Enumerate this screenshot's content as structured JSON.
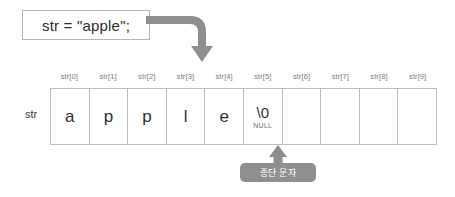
{
  "diagram": {
    "code_box": {
      "text": "str = \"apple\";"
    },
    "array": {
      "row_label": "str",
      "index_labels": [
        "str[0]",
        "str[1]",
        "str[2]",
        "str[3]",
        "str[4]",
        "str[5]",
        "str[6]",
        "str[7]",
        "str[8]",
        "str[9]"
      ],
      "cells": [
        {
          "value": "a",
          "sub": ""
        },
        {
          "value": "p",
          "sub": ""
        },
        {
          "value": "p",
          "sub": ""
        },
        {
          "value": "l",
          "sub": ""
        },
        {
          "value": "e",
          "sub": ""
        },
        {
          "value": "\\0",
          "sub": "NULL"
        },
        {
          "value": "",
          "sub": ""
        },
        {
          "value": "",
          "sub": ""
        },
        {
          "value": "",
          "sub": ""
        },
        {
          "value": "",
          "sub": ""
        }
      ]
    },
    "callout": {
      "label": "종단 문자"
    },
    "colors": {
      "arrow": "#8f8f8f",
      "badge": "#8f8f8f",
      "cell_border": "#bcbcbc",
      "box_border": "#b6b6b6",
      "index_text": "#7a7a7a",
      "glyph_text": "#2e2e2e"
    }
  }
}
